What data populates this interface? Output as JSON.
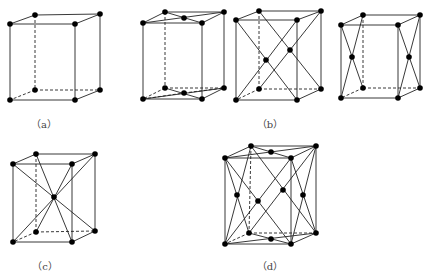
{
  "figures": [
    {
      "id": "a",
      "label": "（a）",
      "label_pos": [
        44,
        123
      ],
      "description": "simple tetragonal lattice (corner atoms only)",
      "corners": {
        "tfl": [
          10,
          24
        ],
        "tfr": [
          75,
          24
        ],
        "tbl": [
          35,
          15
        ],
        "tbr": [
          100,
          14
        ],
        "bfl": [
          10,
          100
        ],
        "bfr": [
          75,
          100
        ],
        "bbl": [
          35,
          90
        ],
        "bbr": [
          100,
          90
        ]
      },
      "extra_atoms": [],
      "lines": []
    },
    {
      "id": "b1",
      "label": "",
      "description": "base-centered tetragonal (top & bottom face centers)",
      "corners": {
        "tfl": [
          143,
          23
        ],
        "tfr": [
          202,
          23
        ],
        "tbl": [
          165,
          12
        ],
        "tbr": [
          224,
          12
        ],
        "bfl": [
          143,
          99
        ],
        "bfr": [
          202,
          99
        ],
        "bbl": [
          165,
          88
        ],
        "bbr": [
          224,
          88
        ]
      },
      "extra_atoms": [
        [
          184,
          18
        ],
        [
          184,
          93
        ]
      ],
      "lines": [
        [
          [
            143,
            23
          ],
          [
            224,
            12
          ]
        ],
        [
          [
            165,
            12
          ],
          [
            202,
            23
          ]
        ],
        [
          [
            143,
            99
          ],
          [
            224,
            88
          ]
        ],
        [
          [
            165,
            88
          ],
          [
            202,
            99
          ]
        ]
      ],
      "dashed_lines": [
        [
          [
            143,
            99
          ],
          [
            184,
            93
          ]
        ],
        [
          [
            184,
            93
          ],
          [
            224,
            88
          ]
        ]
      ]
    },
    {
      "id": "b2",
      "label": "（b）",
      "label_pos": [
        270,
        123
      ],
      "description": "face-centered (front & back face diagonals)",
      "corners": {
        "tfl": [
          236,
          20
        ],
        "tfr": [
          297,
          20
        ],
        "tbl": [
          259,
          11
        ],
        "tbr": [
          321,
          11
        ],
        "bfl": [
          236,
          100
        ],
        "bfr": [
          297,
          100
        ],
        "bbl": [
          259,
          89
        ],
        "bbr": [
          321,
          89
        ]
      },
      "extra_atoms": [
        [
          266,
          60
        ],
        [
          290,
          50
        ]
      ],
      "lines": [
        [
          [
            236,
            20
          ],
          [
            297,
            100
          ]
        ],
        [
          [
            297,
            20
          ],
          [
            236,
            100
          ]
        ],
        [
          [
            259,
            11
          ],
          [
            321,
            89
          ]
        ],
        [
          [
            321,
            11
          ],
          [
            259,
            89
          ]
        ]
      ]
    },
    {
      "id": "b3",
      "label": "",
      "description": "side-face centered tetragonal",
      "corners": {
        "tfl": [
          341,
          25
        ],
        "tfr": [
          398,
          25
        ],
        "tbl": [
          363,
          15
        ],
        "tbr": [
          420,
          15
        ],
        "bfl": [
          341,
          98
        ],
        "bfr": [
          398,
          98
        ],
        "bbl": [
          363,
          88
        ],
        "bbr": [
          420,
          88
        ]
      },
      "extra_atoms": [
        [
          352,
          57
        ],
        [
          409,
          57
        ]
      ],
      "lines": [
        [
          [
            341,
            25
          ],
          [
            363,
            88
          ]
        ],
        [
          [
            363,
            15
          ],
          [
            341,
            98
          ]
        ],
        [
          [
            398,
            25
          ],
          [
            420,
            88
          ]
        ],
        [
          [
            420,
            15
          ],
          [
            398,
            98
          ]
        ]
      ]
    },
    {
      "id": "c",
      "label": "（c）",
      "label_pos": [
        45,
        265
      ],
      "description": "body-centered tetragonal",
      "corners": {
        "tfl": [
          13,
          164
        ],
        "tfr": [
          72,
          164
        ],
        "tbl": [
          36,
          154
        ],
        "tbr": [
          95,
          154
        ],
        "bfl": [
          13,
          242
        ],
        "bfr": [
          72,
          242
        ],
        "bbl": [
          36,
          232
        ],
        "bbr": [
          95,
          231
        ]
      },
      "extra_atoms": [
        [
          54,
          197
        ]
      ],
      "lines": [
        [
          [
            13,
            164
          ],
          [
            95,
            231
          ]
        ],
        [
          [
            72,
            164
          ],
          [
            36,
            232
          ]
        ],
        [
          [
            36,
            154
          ],
          [
            72,
            242
          ]
        ],
        [
          [
            95,
            154
          ],
          [
            13,
            242
          ]
        ]
      ]
    },
    {
      "id": "d",
      "label": "（d）",
      "label_pos": [
        270,
        265
      ],
      "description": "face-centered tetragonal (all face centers)",
      "corners": {
        "tfl": [
          225,
          158
        ],
        "tfr": [
          291,
          158
        ],
        "tbl": [
          251,
          146
        ],
        "tbr": [
          316,
          146
        ],
        "bfl": [
          225,
          244
        ],
        "bfr": [
          291,
          244
        ],
        "bbl": [
          249,
          233
        ],
        "bbr": [
          316,
          233
        ]
      },
      "extra_atoms": [
        [
          271,
          152
        ],
        [
          271,
          239
        ],
        [
          237,
          195
        ],
        [
          303,
          195
        ],
        [
          258,
          201
        ],
        [
          283,
          190
        ]
      ],
      "lines": [
        [
          [
            225,
            158
          ],
          [
            316,
            146
          ]
        ],
        [
          [
            251,
            146
          ],
          [
            291,
            158
          ]
        ],
        [
          [
            225,
            244
          ],
          [
            316,
            233
          ]
        ],
        [
          [
            249,
            233
          ],
          [
            291,
            244
          ]
        ],
        [
          [
            225,
            158
          ],
          [
            249,
            233
          ]
        ],
        [
          [
            251,
            146
          ],
          [
            225,
            244
          ]
        ],
        [
          [
            291,
            158
          ],
          [
            316,
            233
          ]
        ],
        [
          [
            316,
            146
          ],
          [
            291,
            244
          ]
        ],
        [
          [
            225,
            158
          ],
          [
            291,
            244
          ]
        ],
        [
          [
            291,
            158
          ],
          [
            225,
            244
          ]
        ],
        [
          [
            251,
            146
          ],
          [
            316,
            233
          ]
        ],
        [
          [
            316,
            146
          ],
          [
            249,
            233
          ]
        ]
      ]
    }
  ]
}
